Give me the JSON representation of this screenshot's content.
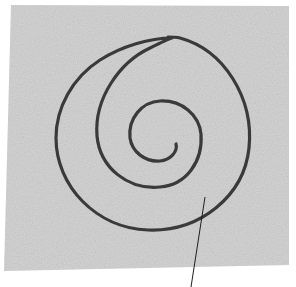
{
  "scene": {
    "description": "Hand-drawn spiral on a sheet of grey textured paper with a thin pointer line",
    "background_color": "#ffffff",
    "paper": {
      "color": "#d4d4d4",
      "corners": [
        [
          11,
          5
        ],
        [
          289,
          6
        ],
        [
          289,
          265
        ],
        [
          4,
          271
        ]
      ]
    },
    "spiral": {
      "color": "#3a3a3a",
      "stroke_width": 3.2,
      "path": "M176,144 C178,152 170,160 160,161 C145,162 132,152 130,138 C128,118 142,102 160,101 C182,100 199,115 201,134 C203,162 186,185 160,187 C128,190 100,168 97,136 C94,98 120,62 150,48 C160,43 168,39 172,38 C150,38 122,46 100,60 C72,78 56,108 56,138 C56,186 96,228 148,230 C200,232 244,196 249,148 C254,98 224,50 180,38 C176,37 172,37 168,37"
    },
    "pointer": {
      "color": "#1e1e1e",
      "stroke_width": 1,
      "from": [
        205,
        197
      ],
      "to": [
        191,
        287
      ]
    }
  }
}
